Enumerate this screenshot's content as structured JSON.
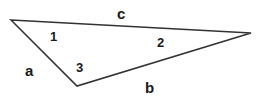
{
  "diagram": {
    "type": "triangle",
    "stroke_color": "#333333",
    "background": "#ffffff",
    "vertices": [
      {
        "id": "left",
        "x": 11,
        "y": 20
      },
      {
        "id": "right",
        "x": 251,
        "y": 33
      },
      {
        "id": "bottom",
        "x": 77,
        "y": 86
      }
    ],
    "sides": {
      "a": {
        "label": "a",
        "between": [
          "left",
          "bottom"
        ]
      },
      "b": {
        "label": "b",
        "between": [
          "bottom",
          "right"
        ]
      },
      "c": {
        "label": "c",
        "between": [
          "left",
          "right"
        ]
      }
    },
    "angles": {
      "angle_1": {
        "label": "1",
        "at": "left"
      },
      "angle_2": {
        "label": "2",
        "at": "right"
      },
      "angle_3": {
        "label": "3",
        "at": "bottom"
      }
    }
  }
}
